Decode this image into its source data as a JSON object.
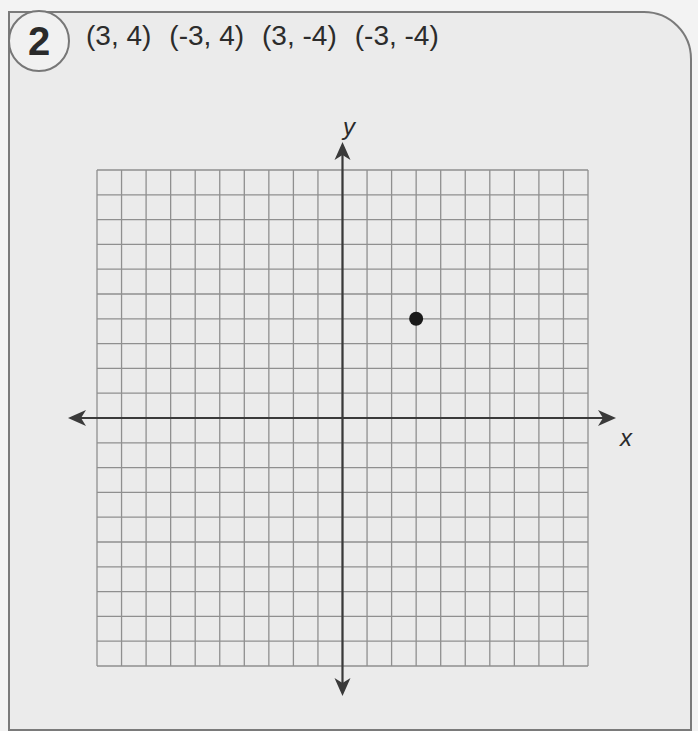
{
  "problem": {
    "number": "2",
    "coordinates": [
      "(3, 4)",
      "(-3, 4)",
      "(3, -4)",
      "(-3, -4)"
    ]
  },
  "axes": {
    "x_label": "x",
    "y_label": "y"
  },
  "grid": {
    "x_min": -10,
    "x_max": 10,
    "y_min": -10,
    "y_max": 10,
    "cells": 20,
    "line_color": "#8f8f8f",
    "axis_color": "#3a3a3a"
  },
  "plotted_points": [
    {
      "x": 3,
      "y": 4,
      "color": "#1a1a1a"
    }
  ],
  "chart_data": {
    "type": "scatter",
    "title": "",
    "xlabel": "x",
    "ylabel": "y",
    "xlim": [
      -10,
      10
    ],
    "ylim": [
      -10,
      10
    ],
    "grid": true,
    "series": [
      {
        "name": "plotted",
        "x": [
          3
        ],
        "y": [
          4
        ]
      }
    ],
    "annotations": [
      "(3, 4)",
      "(-3, 4)",
      "(3, -4)",
      "(-3, -4)"
    ]
  }
}
